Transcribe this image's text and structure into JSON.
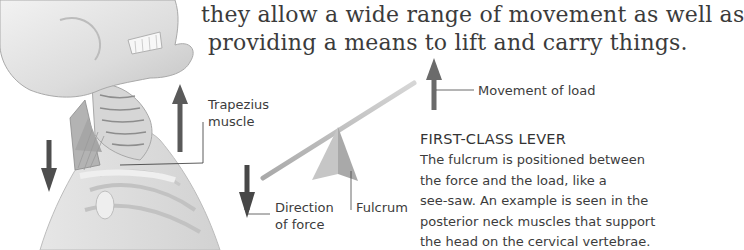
{
  "intro_text": {
    "line1": "they allow a wide range of movement as well as",
    "line2": "providing a means to lift and carry things."
  },
  "labels": {
    "trapezius_line1": "Trapezius",
    "trapezius_line2": "muscle",
    "movement_of_load": "Movement of load",
    "direction_line1": "Direction",
    "direction_line2": "of force",
    "fulcrum": "Fulcrum"
  },
  "section": {
    "heading": "FIRST-CLASS LEVER",
    "lines": [
      "The fulcrum is positioned between",
      "the force and the load, like a",
      "see-saw. An example is seen in the",
      "posterior neck muscles that support",
      "the head on the cervical vertebrae."
    ]
  },
  "illustration": {
    "subject": "skull-neck-shoulder-anatomy",
    "arrow_color": "#555555",
    "lever_color": "#bdbdbd",
    "fulcrum_color": "#b0b0b0"
  }
}
